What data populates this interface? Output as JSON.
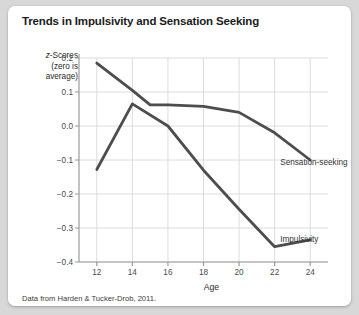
{
  "card": {
    "title": "Trends in Impulsivity and Sensation Seeking",
    "source_note": "Data from Harden & Tucker-Drob, 2011.",
    "background": "#ffffff",
    "page_background": "#d8d8d8"
  },
  "axis_caption": {
    "line1_prefix": "z",
    "line1_rest": "-Scores",
    "line2": "(zero is",
    "line3": "average)"
  },
  "chart_data": {
    "type": "line",
    "title": "Trends in Impulsivity and Sensation Seeking",
    "xlabel": "Age",
    "ylabel": "z-Scores (zero is average)",
    "xlim": [
      11,
      25
    ],
    "ylim": [
      -0.4,
      0.2
    ],
    "xticks": [
      12,
      14,
      16,
      18,
      20,
      22,
      24
    ],
    "yticks": [
      0.2,
      0.1,
      0.0,
      -0.1,
      -0.2,
      -0.3,
      -0.4
    ],
    "xtick_labels": [
      "12",
      "14",
      "16",
      "18",
      "20",
      "22",
      "24"
    ],
    "ytick_labels": [
      "0.2",
      "0.1",
      "0.0",
      "−0.1",
      "−0.2",
      "−0.3",
      "−0.4"
    ],
    "grid": true,
    "grid_color": "#dcdcdc",
    "legend": "inline-annotations",
    "line_color": "#4d4d4d",
    "line_width": 2.8,
    "series": [
      {
        "name": "Sensation-seeking",
        "label": "Sensation-seeking",
        "color": "#4d4d4d",
        "label_x": 24,
        "label_y": -0.105,
        "x": [
          12,
          14,
          15,
          16,
          18,
          20,
          22,
          24
        ],
        "y": [
          0.185,
          0.105,
          0.062,
          0.062,
          0.058,
          0.04,
          -0.02,
          -0.1
        ]
      },
      {
        "name": "Impulsivity",
        "label": "Impulsivity",
        "color": "#4d4d4d",
        "label_x": 24,
        "label_y": -0.332,
        "x": [
          12,
          14,
          16,
          18,
          20,
          22,
          24
        ],
        "y": [
          -0.128,
          0.065,
          0.0,
          -0.13,
          -0.245,
          -0.355,
          -0.335
        ]
      }
    ]
  }
}
